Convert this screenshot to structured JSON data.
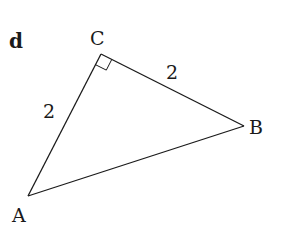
{
  "diagram": {
    "panel_label": "d",
    "vertices": [
      {
        "name": "A",
        "x": 28,
        "y": 196
      },
      {
        "name": "B",
        "x": 244,
        "y": 126
      },
      {
        "name": "C",
        "x": 101,
        "y": 54
      }
    ],
    "side_labels": {
      "AC": "2",
      "CB": "2"
    },
    "right_angle_at": "C",
    "stroke_color": "#1a1a1a"
  }
}
